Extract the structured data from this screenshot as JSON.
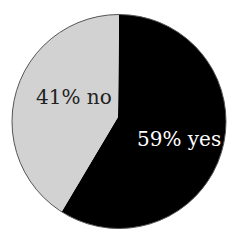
{
  "chart_data": {
    "type": "pie",
    "title": "",
    "categories": [
      "yes",
      "no"
    ],
    "values": [
      59,
      41
    ],
    "unit": "%",
    "labels": [
      "59% yes",
      "41% no"
    ],
    "colors": [
      "#000000",
      "#d2d2d2"
    ],
    "legend": "none (labels inside slices)"
  },
  "slices": [
    {
      "label": "59% yes",
      "value": 59,
      "color": "#000000",
      "text_color": "#ffffff"
    },
    {
      "label": "41% no",
      "value": 41,
      "color": "#d2d2d2",
      "text_color": "#222222"
    }
  ]
}
